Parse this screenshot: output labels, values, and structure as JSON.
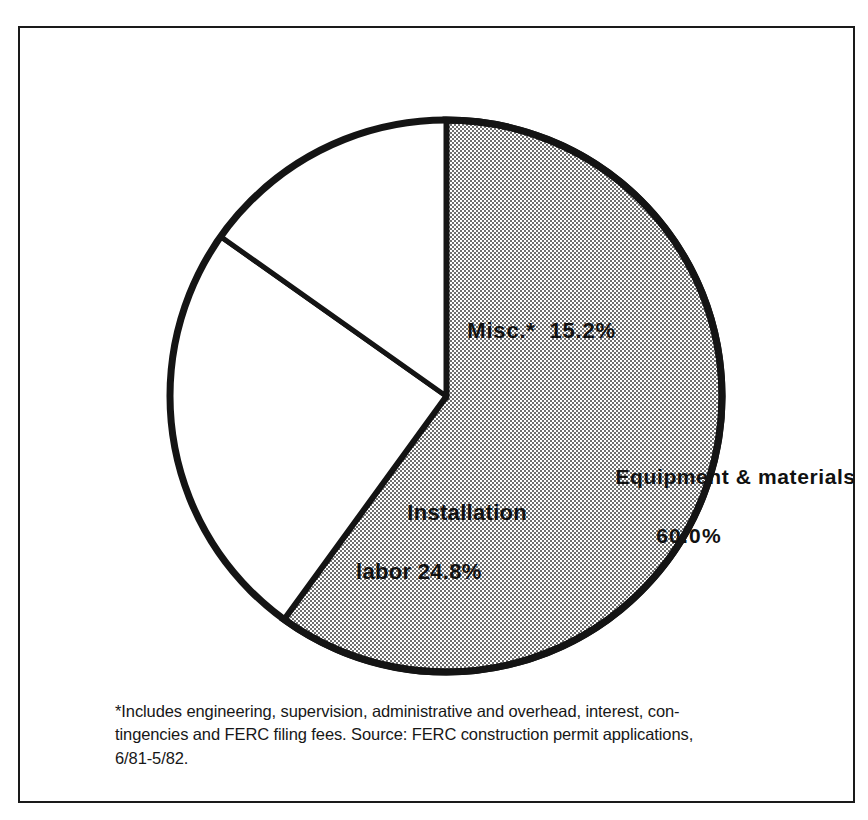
{
  "figure": {
    "frame_color": "#1a1a1a",
    "background_color": "#ffffff"
  },
  "chart_data": {
    "type": "pie",
    "title": "",
    "subtitle": "",
    "xlabel": "",
    "ylabel": "",
    "grid": false,
    "legend_position": "none",
    "start_angle_deg": 0,
    "direction": "clockwise",
    "units": "percent",
    "categories": [
      "Equipment & materials",
      "Installation labor",
      "Misc.*"
    ],
    "values": [
      60.0,
      24.8,
      15.2
    ],
    "slices": [
      {
        "name": "Equipment & materials",
        "label": "Equipment & materials",
        "value": 60.0,
        "value_label": "60.0%",
        "fill": "halftone-gray",
        "fill_color": "#a9a9a9",
        "start_deg": 0,
        "sweep_deg": 216
      },
      {
        "name": "Installation labor",
        "label": "Installation labor",
        "value": 24.8,
        "value_label": "24.8%",
        "fill": "white",
        "fill_color": "#ffffff",
        "start_deg": 216,
        "sweep_deg": 89.28
      },
      {
        "name": "Misc.",
        "label": "Misc.*",
        "value": 15.2,
        "value_label": "15.2%",
        "fill": "white",
        "fill_color": "#ffffff",
        "start_deg": 305.28,
        "sweep_deg": 54.72
      }
    ],
    "annotations": [
      "*Includes engineering, supervision, administrative and overhead, interest, contingencies and FERC filing fees.",
      "Source: FERC construction permit applications, 6/81-5/82."
    ]
  },
  "labels": {
    "equipment": {
      "name": "Equipment & materials",
      "percent": "60.0%"
    },
    "misc": {
      "text": "Misc.*  15.2%"
    },
    "installation": {
      "name": "Installation",
      "percent": "labor 24.8%"
    }
  },
  "footnote": {
    "line1": "*Includes engineering, supervision, administrative and overhead, interest, con-",
    "line2": "tingencies and FERC filing fees. Source: FERC construction permit applications,",
    "line3": "6/81-5/82."
  }
}
